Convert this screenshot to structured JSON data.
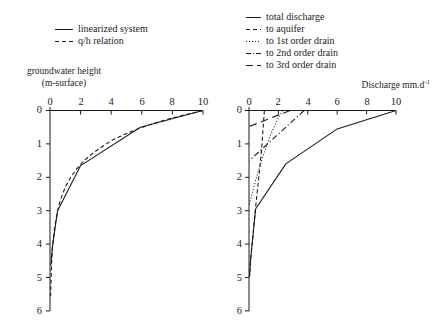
{
  "figure": {
    "background": "#ffffff",
    "line_color": "#1c1c1c"
  },
  "left_chart": {
    "axis_title_line1": "groundwater height",
    "axis_title_line2": "(m-surface)",
    "x_tick_labels": [
      "0",
      "2",
      "4",
      "6",
      "8",
      "10"
    ],
    "y_tick_labels": [
      "0",
      "1",
      "2",
      "3",
      "4",
      "5",
      "6"
    ],
    "legend": [
      {
        "label": "linearized system",
        "dash": "solid"
      },
      {
        "label": "q/h relation",
        "dash": "dashed"
      }
    ]
  },
  "right_chart": {
    "x_axis_title": "Discharge mm.d",
    "x_axis_title_superscript": "-1",
    "x_tick_labels": [
      "0",
      "2",
      "4",
      "6",
      "8",
      "10"
    ],
    "y_tick_labels": [
      "0",
      "1",
      "2",
      "3",
      "4",
      "5",
      "6"
    ],
    "legend": [
      {
        "label": "total discharge",
        "dash": "solid"
      },
      {
        "label": "to aquifer",
        "dash": "dashed"
      },
      {
        "label": "to 1st order drain",
        "dash": "dotted"
      },
      {
        "label": "to 2nd order drain",
        "dash": "dashdot"
      },
      {
        "label": "to 3rd order drain",
        "dash": "longdash"
      }
    ]
  },
  "chart_data": [
    {
      "type": "line",
      "title": "",
      "xlabel": "",
      "ylabel": "groundwater height (m-surface)",
      "xlim": [
        0,
        10
      ],
      "ylim": [
        0,
        6
      ],
      "y_axis_inverted": true,
      "grid": false,
      "legend_position": "above-left",
      "x_ticks": [
        0,
        2,
        4,
        6,
        8,
        10
      ],
      "y_ticks": [
        0,
        1,
        2,
        3,
        4,
        5,
        6
      ],
      "series": [
        {
          "name": "linearized system",
          "dash": "solid",
          "points": [
            [
              10,
              0
            ],
            [
              5.9,
              0.5
            ],
            [
              2.0,
              1.65
            ],
            [
              0.5,
              3.0
            ],
            [
              0.15,
              4.1
            ],
            [
              0.05,
              4.65
            ]
          ]
        },
        {
          "name": "q/h relation",
          "dash": "dashed",
          "points": [
            [
              10,
              0
            ],
            [
              8.8,
              0.13
            ],
            [
              7.8,
              0.25
            ],
            [
              6.9,
              0.37
            ],
            [
              6.05,
              0.5
            ],
            [
              5.35,
              0.62
            ],
            [
              4.7,
              0.75
            ],
            [
              4.1,
              0.88
            ],
            [
              3.68,
              1.0
            ],
            [
              2.87,
              1.25
            ],
            [
              2.23,
              1.5
            ],
            [
              1.74,
              1.75
            ],
            [
              1.35,
              2.0
            ],
            [
              1.05,
              2.25
            ],
            [
              0.82,
              2.5
            ],
            [
              0.64,
              2.75
            ],
            [
              0.5,
              3.0
            ],
            [
              0.3,
              3.5
            ],
            [
              0.18,
              4.0
            ],
            [
              0.11,
              4.5
            ],
            [
              0.07,
              5.0
            ],
            [
              0.04,
              5.55
            ]
          ]
        }
      ]
    },
    {
      "type": "line",
      "title": "",
      "xlabel": "Discharge mm.d-1",
      "ylabel": "",
      "xlim": [
        0,
        10
      ],
      "ylim": [
        0,
        6
      ],
      "y_axis_inverted": true,
      "grid": false,
      "legend_position": "above-left",
      "x_ticks": [
        0,
        2,
        4,
        6,
        8,
        10
      ],
      "y_ticks": [
        0,
        1,
        2,
        3,
        4,
        5,
        6
      ],
      "series": [
        {
          "name": "total discharge",
          "dash": "solid",
          "points": [
            [
              10,
              0
            ],
            [
              6.0,
              0.55
            ],
            [
              2.5,
              1.6
            ],
            [
              0.45,
              2.95
            ],
            [
              0.1,
              4.5
            ],
            [
              0.04,
              4.97
            ]
          ]
        },
        {
          "name": "to aquifer",
          "dash": "dashed",
          "points": [
            [
              1.05,
              0
            ],
            [
              0.85,
              1.2
            ],
            [
              0.62,
              2.2
            ],
            [
              0.45,
              2.9
            ],
            [
              0.1,
              4.5
            ],
            [
              0.04,
              4.97
            ]
          ]
        },
        {
          "name": "to 1st order drain",
          "dash": "dotted",
          "points": [
            [
              2.3,
              0
            ],
            [
              1.9,
              0.3
            ],
            [
              1.35,
              0.85
            ],
            [
              0.85,
              1.5
            ],
            [
              0.45,
              2.1
            ],
            [
              0.15,
              2.6
            ],
            [
              0.02,
              2.82
            ]
          ]
        },
        {
          "name": "to 2nd order drain",
          "dash": "dashdot",
          "points": [
            [
              3.75,
              0
            ],
            [
              0.02,
              1.5
            ]
          ]
        },
        {
          "name": "to 3rd order drain",
          "dash": "longdash",
          "points": [
            [
              2.8,
              0
            ],
            [
              0.02,
              0.48
            ]
          ]
        }
      ]
    }
  ]
}
